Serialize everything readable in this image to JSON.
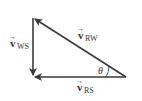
{
  "diagram": {
    "type": "vector-triangle",
    "colors": {
      "line": "#3a3a3a",
      "background": "#ffffff"
    },
    "vectors": [
      {
        "id": "ws",
        "symbol": "v",
        "subscript": "WS",
        "from": "bottom-left",
        "to": "top-left",
        "direction": "down"
      },
      {
        "id": "rw",
        "symbol": "v",
        "subscript": "RW",
        "from": "right",
        "to": "top-left"
      },
      {
        "id": "rs",
        "symbol": "v",
        "subscript": "RS",
        "from": "right",
        "to": "bottom-left"
      }
    ],
    "labels": {
      "ws": {
        "symbol": "v",
        "arrow": "→",
        "sub": "WS"
      },
      "rw": {
        "symbol": "v",
        "arrow": "→",
        "sub": "RW"
      },
      "rs": {
        "symbol": "v",
        "arrow": "→",
        "sub": "RS"
      },
      "angle": "θ"
    }
  }
}
